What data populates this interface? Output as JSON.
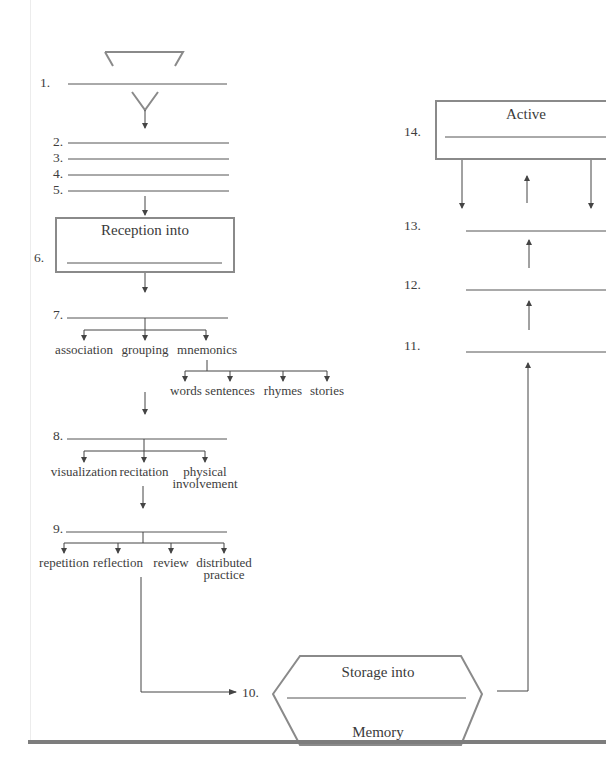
{
  "diagram": {
    "colors": {
      "line": "#5a5a5a",
      "box_border": "#8a8a8a",
      "text": "#3d3d3d",
      "bottom_bar": "#7d7d7d"
    },
    "blanks": {
      "b1": "1.",
      "b2": "2.",
      "b3": "3.",
      "b4": "4.",
      "b5": "5.",
      "b6": "6.",
      "b7": "7.",
      "b8": "8.",
      "b9": "9.",
      "b10": "10.",
      "b11": "11.",
      "b12": "12.",
      "b13": "13.",
      "b14": "14."
    },
    "box6": {
      "title": "Reception into"
    },
    "step7": {
      "children": [
        "association",
        "grouping",
        "mnemonics"
      ],
      "mnemonics_children": [
        "words",
        "sentences",
        "rhymes",
        "stories"
      ]
    },
    "step8": {
      "children": [
        "visualization",
        "recitation",
        "physical",
        "involvement"
      ]
    },
    "step9": {
      "children": [
        "repetition",
        "reflection",
        "review",
        "distributed",
        "practice"
      ]
    },
    "storage": {
      "top": "Storage into",
      "bottom": "Memory"
    },
    "box14": {
      "title": "Active"
    }
  }
}
